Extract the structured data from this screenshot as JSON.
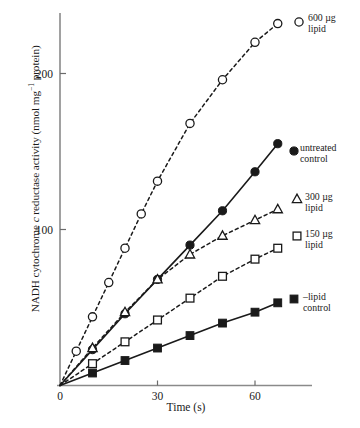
{
  "chart_data": {
    "type": "line",
    "title": "",
    "xlabel": "Time (s)",
    "ylabel": "NADH cytochrome c reductase activity (nmol mg⁻¹ protein)",
    "ylabel_parts": {
      "pre": "NADH cytochrome ",
      "italic": "c",
      "post": " reductase activity (nmol mg",
      "sup": "−1",
      "tail": " protein)"
    },
    "xlim": [
      0,
      68
    ],
    "ylim": [
      0,
      245
    ],
    "xticks": [
      0,
      30,
      60
    ],
    "xtick_labels": [
      "0",
      "30",
      "60"
    ],
    "yticks": [
      100,
      200
    ],
    "ytick_labels": [
      "100",
      "200"
    ],
    "grid": false,
    "legend_position": "right-inline",
    "series": [
      {
        "name": "600 µg lipid",
        "label_line1": "600 µg",
        "label_line2": "lipid",
        "marker": "open-circle",
        "linestyle": "dashed",
        "color": "#1a1a1a",
        "x": [
          0,
          5,
          10,
          15,
          20,
          25,
          30,
          40,
          50,
          60,
          67
        ],
        "y": [
          0,
          22,
          44,
          66,
          88,
          110,
          131,
          168,
          196,
          220,
          232
        ]
      },
      {
        "name": "untreated control",
        "label_line1": "untreated",
        "label_line2": "control",
        "marker": "filled-circle",
        "linestyle": "solid",
        "color": "#1a1a1a",
        "x": [
          0,
          10,
          20,
          30,
          40,
          50,
          60,
          67
        ],
        "y": [
          0,
          23,
          46,
          68,
          90,
          112,
          137,
          155
        ]
      },
      {
        "name": "300 µg lipid",
        "label_line1": "300 µg",
        "label_line2": "lipid",
        "marker": "open-triangle",
        "linestyle": "dashed",
        "color": "#1a1a1a",
        "x": [
          0,
          10,
          20,
          30,
          40,
          50,
          60,
          67
        ],
        "y": [
          0,
          24,
          47,
          68,
          84,
          96,
          106,
          113
        ]
      },
      {
        "name": "150 µg lipid",
        "label_line1": "150 µg",
        "label_line2": "lipid",
        "marker": "open-square",
        "linestyle": "dashed",
        "color": "#1a1a1a",
        "x": [
          0,
          10,
          20,
          30,
          40,
          50,
          60,
          67
        ],
        "y": [
          0,
          14,
          28,
          42,
          56,
          70,
          81,
          88
        ]
      },
      {
        "name": "–lipid control",
        "label_line1": "–lipid",
        "label_line2": "control",
        "marker": "filled-square",
        "linestyle": "solid",
        "color": "#1a1a1a",
        "x": [
          0,
          10,
          20,
          30,
          40,
          50,
          60,
          67
        ],
        "y": [
          0,
          8,
          16,
          24,
          32,
          40,
          47,
          53
        ]
      }
    ]
  },
  "axes": {
    "x_title": "Time (s)",
    "x_tick_0": "0",
    "x_tick_30": "30",
    "x_tick_60": "60",
    "y_tick_100": "100",
    "y_tick_200": "200"
  },
  "labels": {
    "s600_l1": "600 µg",
    "s600_l2": "lipid",
    "untreated_l1": "untreated",
    "untreated_l2": "control",
    "s300_l1": "300 µg",
    "s300_l2": "lipid",
    "s150_l1": "150 µg",
    "s150_l2": "lipid",
    "nolipid_l1": "–lipid",
    "nolipid_l2": "control"
  },
  "style": {
    "ink": "#1a1a1a",
    "axis": "#6b6b6b",
    "background": "#ffffff"
  }
}
